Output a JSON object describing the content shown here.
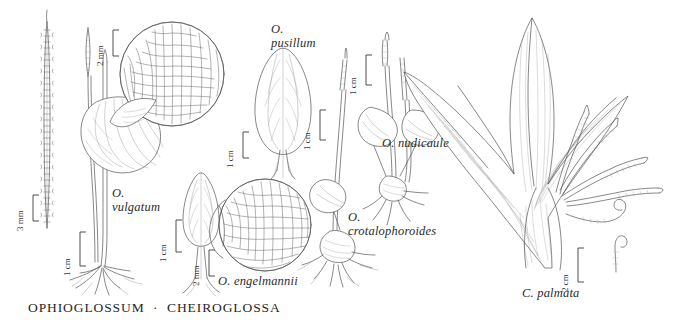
{
  "plate": {
    "caption": "OPHIOGLOSSUM  ·  CHEIROGLOSSA",
    "background_color": "#ffffff",
    "ink_color": "#4a4a4a",
    "line_color": "#555555"
  },
  "species_labels": [
    {
      "id": "vulgatum",
      "line1": "O.",
      "line2": "vulgatum"
    },
    {
      "id": "pusillum",
      "line1": "O.",
      "line2": "pusillum"
    },
    {
      "id": "engelmannii",
      "line1": "O. engelmannii",
      "line2": ""
    },
    {
      "id": "nudicaule",
      "line1": "O. nudicaule",
      "line2": ""
    },
    {
      "id": "crotalophoroides",
      "line1": "O.",
      "line2": "crotalophoroides"
    },
    {
      "id": "palmata",
      "line1": "C. palmata",
      "line2": ""
    }
  ],
  "scale_bars": [
    {
      "id": "scale-vulgatum-sporangia",
      "label": "3 mm"
    },
    {
      "id": "scale-vulgatum-venation",
      "label": "2 mm"
    },
    {
      "id": "scale-vulgatum-habit",
      "label": "1 cm"
    },
    {
      "id": "scale-pusillum",
      "label": "1 cm"
    },
    {
      "id": "scale-engelmannii-habit",
      "label": "1 cm"
    },
    {
      "id": "scale-engelmannii-venation",
      "label": "2 mm"
    },
    {
      "id": "scale-nudicaule",
      "label": "1 cm"
    },
    {
      "id": "scale-crotalophoroides",
      "label": "1 cm"
    },
    {
      "id": "scale-palmata",
      "label": "2 cm"
    }
  ]
}
